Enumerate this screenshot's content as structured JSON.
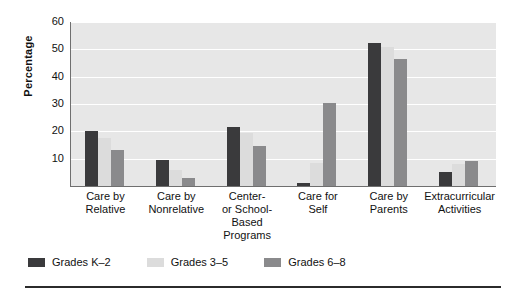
{
  "chart_data": {
    "type": "bar",
    "title": "",
    "xlabel": "",
    "ylabel": "Percentage",
    "ylim": [
      0,
      60
    ],
    "yticks": [
      10,
      20,
      30,
      40,
      50,
      60
    ],
    "grid": true,
    "legend_position": "bottom-left",
    "categories": [
      "Care by Relative",
      "Care by Nonrelative",
      "Center- or School-Based Programs",
      "Care for Self",
      "Care by Parents",
      "Extracurricular Activities"
    ],
    "category_lines": [
      [
        "Care by",
        "Relative"
      ],
      [
        "Care by",
        "Nonrelative"
      ],
      [
        "Center-",
        "or School-",
        "Based",
        "Programs"
      ],
      [
        "Care for",
        "Self"
      ],
      [
        "Care by",
        "Parents"
      ],
      [
        "Extracurricular",
        "Activities"
      ]
    ],
    "series": [
      {
        "name": "Grades K–2",
        "color": "#3a3a3c",
        "values": [
          20,
          9.5,
          21.5,
          1,
          52.5,
          5
        ]
      },
      {
        "name": "Grades 3–5",
        "color": "#dcdcdc",
        "values": [
          17.5,
          6,
          19.5,
          8.5,
          51,
          8
        ]
      },
      {
        "name": "Grades 6–8",
        "color": "#8a8a8c",
        "values": [
          13,
          3,
          14.5,
          30.5,
          46.5,
          9
        ]
      }
    ]
  },
  "axis": {
    "y_title": "Percentage",
    "y_tick_labels": [
      "60",
      "50",
      "40",
      "30",
      "20",
      "10"
    ]
  },
  "legend": {
    "items": [
      {
        "label": "Grades K–2",
        "color": "#3a3a3c"
      },
      {
        "label": "Grades 3–5",
        "color": "#dcdcdc"
      },
      {
        "label": "Grades 6–8",
        "color": "#8a8a8c"
      }
    ]
  },
  "colors": {
    "plot_background": "#e7e7e7",
    "gridline": "#ffffff",
    "axis": "#6f6f6f",
    "rule": "#2b2b2b",
    "page_background": "#ffffff"
  }
}
